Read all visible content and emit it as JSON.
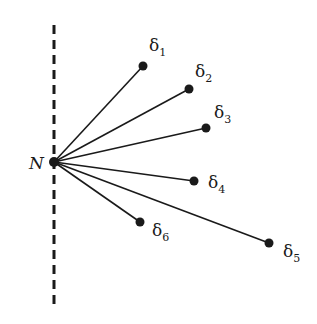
{
  "diagram": {
    "colors": {
      "ink": "#1a1a1a",
      "background": "#ffffff"
    },
    "boundary": {
      "x": 54,
      "y1": 25,
      "y2": 307,
      "style": "dashed"
    },
    "hub": {
      "label": "N",
      "x": 54,
      "y": 162,
      "label_x": 29,
      "label_y": 169
    },
    "nodes": [
      {
        "id": "delta1",
        "symbol": "δ",
        "sub": "1",
        "x": 143,
        "y": 66,
        "lx": 149,
        "ly": 51
      },
      {
        "id": "delta2",
        "symbol": "δ",
        "sub": "2",
        "x": 189,
        "y": 89,
        "lx": 195,
        "ly": 77
      },
      {
        "id": "delta3",
        "symbol": "δ",
        "sub": "3",
        "x": 206,
        "y": 128,
        "lx": 214,
        "ly": 118
      },
      {
        "id": "delta4",
        "symbol": "δ",
        "sub": "4",
        "x": 194,
        "y": 181,
        "lx": 208,
        "ly": 188
      },
      {
        "id": "delta5",
        "symbol": "δ",
        "sub": "5",
        "x": 269,
        "y": 243,
        "lx": 283,
        "ly": 257
      },
      {
        "id": "delta6",
        "symbol": "δ",
        "sub": "6",
        "x": 140,
        "y": 222,
        "lx": 152,
        "ly": 236
      }
    ]
  }
}
